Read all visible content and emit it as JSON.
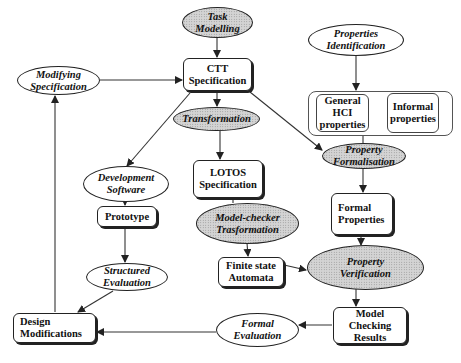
{
  "diagram": {
    "type": "flowchart",
    "colors": {
      "stroke": "#222222",
      "shaded_fill": "#d4d4d4",
      "background": "#ffffff"
    },
    "nodes": {
      "task_modelling": {
        "label": "Task\nModelling",
        "shape": "ellipse",
        "shaded": true
      },
      "ctt_specification": {
        "label": "CTT\nSpecification",
        "shape": "box"
      },
      "modifying_specification": {
        "label": "Modifying\nSpecification",
        "shape": "ellipse",
        "shaded": false
      },
      "transformation": {
        "label": "Transformation",
        "shape": "ellipse",
        "shaded": true
      },
      "properties_identification": {
        "label": "Properties\nIdentification",
        "shape": "ellipse",
        "shaded": false
      },
      "general_hci_properties": {
        "label": "General\nHCI\nproperties",
        "shape": "box"
      },
      "informal_properties": {
        "label": "Informal\nproperties",
        "shape": "box"
      },
      "property_formalisation": {
        "label": "Property\nFormalisation",
        "shape": "ellipse",
        "shaded": true
      },
      "development_software": {
        "label": "Development\nSoftware",
        "shape": "ellipse",
        "shaded": false
      },
      "lotos_specification": {
        "label": "LOTOS\nSpecification",
        "shape": "box"
      },
      "prototype": {
        "label": "Prototype",
        "shape": "box"
      },
      "model_checker_transformation": {
        "label": "Model-checker\nTrasformation",
        "shape": "ellipse",
        "shaded": true
      },
      "formal_properties": {
        "label": "Formal\nProperties",
        "shape": "box"
      },
      "finite_state_automata": {
        "label": "Finite state\nAutomata",
        "shape": "box"
      },
      "property_verification": {
        "label": "Property\nVerification",
        "shape": "ellipse",
        "shaded": true
      },
      "structured_evaluation": {
        "label": "Structured\nEvaluation",
        "shape": "ellipse",
        "shaded": false
      },
      "model_checking_results": {
        "label": "Model Checking\nResults",
        "shape": "box"
      },
      "formal_evaluation": {
        "label": "Formal\nEvaluation",
        "shape": "ellipse",
        "shaded": false
      },
      "design_modifications": {
        "label": "Design\nModifications",
        "shape": "box"
      }
    },
    "edges": [
      {
        "from": "Task Modelling",
        "to": "CTT Specification"
      },
      {
        "from": "Modifying Specification",
        "to": "CTT Specification"
      },
      {
        "from": "CTT Specification",
        "to": "Transformation"
      },
      {
        "from": "CTT Specification",
        "to": "Development Software"
      },
      {
        "from": "CTT Specification",
        "to": "Property Formalisation"
      },
      {
        "from": "Transformation",
        "to": "LOTOS Specification"
      },
      {
        "from": "Properties Identification",
        "to": "General HCI / Informal properties"
      },
      {
        "from": "General HCI properties",
        "to": "Property Formalisation"
      },
      {
        "from": "Property Formalisation",
        "to": "Formal Properties"
      },
      {
        "from": "Development Software",
        "to": "Prototype"
      },
      {
        "from": "LOTOS Specification",
        "to": "Model-checker Trasformation"
      },
      {
        "from": "Model-checker Trasformation",
        "to": "Finite state Automata"
      },
      {
        "from": "Prototype",
        "to": "Structured Evaluation"
      },
      {
        "from": "Formal Properties",
        "to": "Property Verification"
      },
      {
        "from": "Finite state Automata",
        "to": "Property Verification"
      },
      {
        "from": "Property Verification",
        "to": "Model Checking Results"
      },
      {
        "from": "Structured Evaluation",
        "to": "Design Modifications"
      },
      {
        "from": "Model Checking Results",
        "to": "Formal Evaluation"
      },
      {
        "from": "Formal Evaluation",
        "to": "Design Modifications"
      },
      {
        "from": "Design Modifications",
        "to": "Modifying Specification"
      }
    ]
  }
}
